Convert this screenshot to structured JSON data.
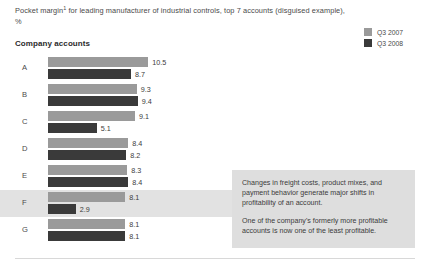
{
  "header": {
    "title_line1_pre": "Pocket margin",
    "title_footnote_marker": "1",
    "title_line1_post": " for leading manufacturer of industrial controls, top 7 accounts",
    "title_line2": "(disguised example), %",
    "subtitle": "Company accounts"
  },
  "legend": {
    "position": "top-right",
    "items": [
      {
        "label": "Q3 2007",
        "color": "#9a9a9a",
        "swatch_name": "legend-swatch-q3-2007"
      },
      {
        "label": "Q3 2008",
        "color": "#3a3a3a",
        "swatch_name": "legend-swatch-q3-2008"
      }
    ]
  },
  "callout": {
    "paragraph1": "Changes in freight costs, product mixes, and payment behavior generate major shifts in profitability of an account.",
    "paragraph2": "One of the company's formerly more profitable accounts is now one of the least profitable.",
    "background_color": "#dedede"
  },
  "highlight": {
    "row": "F",
    "color": "#e2e2e2"
  },
  "chart_data": {
    "type": "bar",
    "orientation": "horizontal",
    "xlabel": "",
    "ylabel": "Company accounts",
    "xlim": [
      0,
      10.5
    ],
    "grid": false,
    "legend_position": "top-right",
    "categories": [
      "A",
      "B",
      "C",
      "D",
      "E",
      "F",
      "G"
    ],
    "series": [
      {
        "name": "Q3 2007",
        "color": "#9a9a9a",
        "values": [
          10.5,
          9.3,
          9.1,
          8.4,
          8.3,
          8.1,
          8.1
        ]
      },
      {
        "name": "Q3 2008",
        "color": "#3a3a3a",
        "values": [
          8.7,
          9.4,
          5.1,
          8.2,
          8.4,
          2.9,
          8.1
        ]
      }
    ],
    "value_labels": [
      {
        "category": "A",
        "q3_2007": "10.5",
        "q3_2008": "8.7"
      },
      {
        "category": "B",
        "q3_2007": "9.3",
        "q3_2008": "9.4"
      },
      {
        "category": "C",
        "q3_2007": "9.1",
        "q3_2008": "5.1"
      },
      {
        "category": "D",
        "q3_2007": "8.4",
        "q3_2008": "8.2"
      },
      {
        "category": "E",
        "q3_2007": "8.3",
        "q3_2008": "8.4"
      },
      {
        "category": "F",
        "q3_2007": "8.1",
        "q3_2008": "2.9"
      },
      {
        "category": "G",
        "q3_2007": "8.1",
        "q3_2008": "8.1"
      }
    ]
  }
}
